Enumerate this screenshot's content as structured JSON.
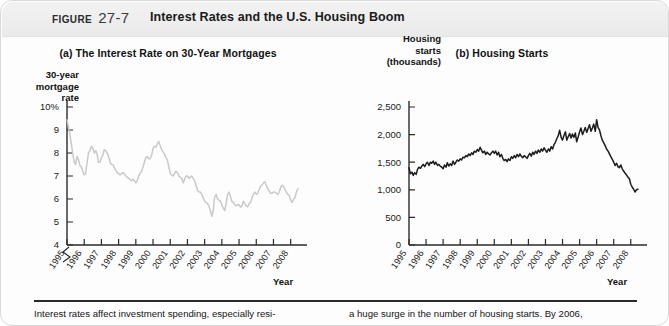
{
  "header": {
    "figure_word": "Figure",
    "figure_number": "27-7",
    "title": "Interest Rates and the U.S. Housing Boom"
  },
  "caption": {
    "left": "Interest rates affect investment spending, especially resi-",
    "right": "a huge surge in the number of housing starts. By 2006,"
  },
  "panel_a": {
    "title": "(a) The Interest Rate on 30-Year Mortgages",
    "ylabel_lines": [
      "30-year",
      "mortgage",
      "rate"
    ],
    "xlabel": "Year"
  },
  "panel_b": {
    "title": "(b) Housing Starts",
    "ylabel_lines": [
      "Housing",
      "starts",
      "(thousands)"
    ],
    "xlabel": "Year"
  },
  "colors": {
    "line_a": "#c9c9c9",
    "line_b": "#1c1c1c",
    "axis": "#2a2a2a",
    "header_bg": "#efefef"
  },
  "chart_data": [
    {
      "type": "line",
      "id": "panel-a",
      "title": "(a) The Interest Rate on 30-Year Mortgages",
      "xlabel": "Year",
      "ylabel": "30-year mortgage rate",
      "grid": false,
      "legend": null,
      "axis_break": true,
      "ylim": [
        4,
        10
      ],
      "xlim": [
        1995,
        2008.6
      ],
      "yticks": [
        4,
        5,
        6,
        7,
        8,
        9,
        10
      ],
      "yticklabels": [
        "4",
        "5",
        "6",
        "7",
        "8",
        "9",
        "10%"
      ],
      "xticks": [
        1995,
        1996,
        1997,
        1998,
        1999,
        2000,
        2001,
        2002,
        2003,
        2004,
        2005,
        2006,
        2007,
        2008
      ],
      "xticklabels": [
        "1995",
        "1996",
        "1997",
        "1998",
        "1999",
        "2000",
        "2001",
        "2002",
        "2003",
        "2004",
        "2005",
        "2006",
        "2007",
        "2008"
      ],
      "x": [
        1995.0,
        1995.08,
        1995.17,
        1995.25,
        1995.33,
        1995.42,
        1995.5,
        1995.58,
        1995.67,
        1995.75,
        1995.83,
        1995.92,
        1996.0,
        1996.08,
        1996.17,
        1996.25,
        1996.33,
        1996.42,
        1996.5,
        1996.58,
        1996.67,
        1996.75,
        1996.83,
        1996.92,
        1997.0,
        1997.08,
        1997.17,
        1997.25,
        1997.33,
        1997.42,
        1997.5,
        1997.58,
        1997.67,
        1997.75,
        1997.83,
        1997.92,
        1998.0,
        1998.08,
        1998.17,
        1998.25,
        1998.33,
        1998.42,
        1998.5,
        1998.58,
        1998.67,
        1998.75,
        1998.83,
        1998.92,
        1999.0,
        1999.08,
        1999.17,
        1999.25,
        1999.33,
        1999.42,
        1999.5,
        1999.58,
        1999.67,
        1999.75,
        1999.83,
        1999.92,
        2000.0,
        2000.08,
        2000.17,
        2000.25,
        2000.33,
        2000.42,
        2000.5,
        2000.58,
        2000.67,
        2000.75,
        2000.83,
        2000.92,
        2001.0,
        2001.08,
        2001.17,
        2001.25,
        2001.33,
        2001.42,
        2001.5,
        2001.58,
        2001.67,
        2001.75,
        2001.83,
        2001.92,
        2002.0,
        2002.08,
        2002.17,
        2002.25,
        2002.33,
        2002.42,
        2002.5,
        2002.58,
        2002.67,
        2002.75,
        2002.83,
        2002.92,
        2003.0,
        2003.08,
        2003.17,
        2003.25,
        2003.33,
        2003.42,
        2003.5,
        2003.58,
        2003.67,
        2003.75,
        2003.83,
        2003.92,
        2004.0,
        2004.08,
        2004.17,
        2004.25,
        2004.33,
        2004.42,
        2004.5,
        2004.58,
        2004.67,
        2004.75,
        2004.83,
        2004.92,
        2005.0,
        2005.08,
        2005.17,
        2005.25,
        2005.33,
        2005.42,
        2005.5,
        2005.58,
        2005.67,
        2005.75,
        2005.83,
        2005.92,
        2006.0,
        2006.08,
        2006.17,
        2006.25,
        2006.33,
        2006.42,
        2006.5,
        2006.58,
        2006.67,
        2006.75,
        2006.83,
        2006.92,
        2007.0,
        2007.08,
        2007.17,
        2007.25,
        2007.33,
        2007.42,
        2007.5,
        2007.58,
        2007.67,
        2007.75,
        2007.83,
        2007.92,
        2008.0,
        2008.08,
        2008.17,
        2008.25,
        2008.33,
        2008.42
      ],
      "y": [
        9.45,
        9.15,
        8.8,
        8.4,
        8.0,
        7.6,
        7.5,
        7.85,
        7.7,
        7.45,
        7.4,
        7.2,
        7.05,
        7.1,
        7.6,
        8.0,
        8.1,
        8.3,
        8.2,
        8.0,
        8.1,
        7.95,
        7.6,
        7.6,
        7.8,
        7.9,
        8.15,
        8.1,
        8.0,
        7.85,
        7.6,
        7.5,
        7.5,
        7.35,
        7.25,
        7.15,
        7.1,
        7.05,
        7.1,
        7.15,
        7.1,
        7.0,
        6.95,
        6.9,
        6.85,
        6.8,
        6.85,
        6.8,
        6.7,
        6.8,
        7.0,
        7.1,
        7.2,
        7.4,
        7.6,
        7.8,
        7.85,
        7.75,
        7.75,
        7.9,
        8.2,
        8.3,
        8.25,
        8.4,
        8.5,
        8.3,
        8.15,
        8.05,
        7.95,
        7.8,
        7.7,
        7.4,
        7.1,
        7.05,
        7.0,
        7.1,
        7.2,
        7.15,
        7.0,
        6.95,
        6.9,
        6.7,
        6.85,
        7.0,
        7.0,
        6.9,
        6.95,
        7.0,
        6.9,
        6.8,
        6.6,
        6.4,
        6.3,
        6.3,
        6.2,
        6.05,
        5.9,
        5.85,
        5.8,
        5.7,
        5.5,
        5.25,
        5.5,
        6.1,
        6.2,
        6.0,
        5.95,
        5.9,
        5.75,
        5.6,
        5.5,
        5.8,
        6.2,
        6.3,
        6.1,
        5.9,
        5.85,
        5.75,
        5.7,
        5.75,
        5.75,
        5.65,
        5.7,
        5.9,
        5.8,
        5.7,
        5.65,
        5.8,
        5.85,
        6.05,
        6.2,
        6.3,
        6.2,
        6.25,
        6.4,
        6.55,
        6.6,
        6.7,
        6.75,
        6.6,
        6.45,
        6.35,
        6.25,
        6.25,
        6.3,
        6.3,
        6.25,
        6.2,
        6.3,
        6.5,
        6.6,
        6.55,
        6.4,
        6.3,
        6.2,
        6.15,
        5.95,
        5.85,
        6.0,
        6.05,
        6.3,
        6.45
      ]
    },
    {
      "type": "line",
      "id": "panel-b",
      "title": "(b) Housing Starts",
      "xlabel": "Year",
      "ylabel": "Housing starts (thousands)",
      "grid": false,
      "legend": null,
      "axis_break": false,
      "ylim": [
        0,
        2500
      ],
      "xlim": [
        1995,
        2008.6
      ],
      "yticks": [
        0,
        500,
        1000,
        1500,
        2000,
        2500
      ],
      "yticklabels": [
        "0",
        "500",
        "1,000",
        "1,500",
        "2,000",
        "2,500"
      ],
      "xticks": [
        1995,
        1996,
        1997,
        1998,
        1999,
        2000,
        2001,
        2002,
        2003,
        2004,
        2005,
        2006,
        2007,
        2008
      ],
      "xticklabels": [
        "1995",
        "1996",
        "1997",
        "1998",
        "1999",
        "2000",
        "2001",
        "2002",
        "2003",
        "2004",
        "2005",
        "2006",
        "2007",
        "2008"
      ],
      "x": [
        1995.0,
        1995.08,
        1995.17,
        1995.25,
        1995.33,
        1995.42,
        1995.5,
        1995.58,
        1995.67,
        1995.75,
        1995.83,
        1995.92,
        1996.0,
        1996.08,
        1996.17,
        1996.25,
        1996.33,
        1996.42,
        1996.5,
        1996.58,
        1996.67,
        1996.75,
        1996.83,
        1996.92,
        1997.0,
        1997.08,
        1997.17,
        1997.25,
        1997.33,
        1997.42,
        1997.5,
        1997.58,
        1997.67,
        1997.75,
        1997.83,
        1997.92,
        1998.0,
        1998.08,
        1998.17,
        1998.25,
        1998.33,
        1998.42,
        1998.5,
        1998.58,
        1998.67,
        1998.75,
        1998.83,
        1998.92,
        1999.0,
        1999.08,
        1999.17,
        1999.25,
        1999.33,
        1999.42,
        1999.5,
        1999.58,
        1999.67,
        1999.75,
        1999.83,
        1999.92,
        2000.0,
        2000.08,
        2000.17,
        2000.25,
        2000.33,
        2000.42,
        2000.5,
        2000.58,
        2000.67,
        2000.75,
        2000.83,
        2000.92,
        2001.0,
        2001.08,
        2001.17,
        2001.25,
        2001.33,
        2001.42,
        2001.5,
        2001.58,
        2001.67,
        2001.75,
        2001.83,
        2001.92,
        2002.0,
        2002.08,
        2002.17,
        2002.25,
        2002.33,
        2002.42,
        2002.5,
        2002.58,
        2002.67,
        2002.75,
        2002.83,
        2002.92,
        2003.0,
        2003.08,
        2003.17,
        2003.25,
        2003.33,
        2003.42,
        2003.5,
        2003.58,
        2003.67,
        2003.75,
        2003.83,
        2003.92,
        2004.0,
        2004.08,
        2004.17,
        2004.25,
        2004.33,
        2004.42,
        2004.5,
        2004.58,
        2004.67,
        2004.75,
        2004.83,
        2004.92,
        2005.0,
        2005.08,
        2005.17,
        2005.25,
        2005.33,
        2005.42,
        2005.5,
        2005.58,
        2005.67,
        2005.75,
        2005.83,
        2005.92,
        2006.0,
        2006.08,
        2006.17,
        2006.25,
        2006.33,
        2006.42,
        2006.5,
        2006.58,
        2006.67,
        2006.75,
        2006.83,
        2006.92,
        2007.0,
        2007.08,
        2007.17,
        2007.25,
        2007.33,
        2007.42,
        2007.5,
        2007.58,
        2007.67,
        2007.75,
        2007.83,
        2007.92,
        2008.0,
        2008.08,
        2008.17,
        2008.25,
        2008.33,
        2008.42
      ],
      "y": [
        1400,
        1290,
        1320,
        1260,
        1310,
        1280,
        1370,
        1410,
        1390,
        1430,
        1460,
        1420,
        1470,
        1500,
        1440,
        1500,
        1480,
        1520,
        1460,
        1500,
        1440,
        1460,
        1430,
        1410,
        1380,
        1450,
        1410,
        1490,
        1430,
        1470,
        1440,
        1520,
        1460,
        1500,
        1540,
        1520,
        1560,
        1540,
        1590,
        1580,
        1620,
        1600,
        1650,
        1620,
        1670,
        1640,
        1700,
        1680,
        1730,
        1700,
        1770,
        1720,
        1670,
        1700,
        1640,
        1680,
        1650,
        1630,
        1670,
        1700,
        1660,
        1700,
        1630,
        1680,
        1600,
        1640,
        1570,
        1530,
        1550,
        1510,
        1560,
        1530,
        1600,
        1570,
        1620,
        1580,
        1640,
        1600,
        1650,
        1610,
        1580,
        1620,
        1600,
        1570,
        1620,
        1660,
        1610,
        1680,
        1640,
        1700,
        1660,
        1720,
        1680,
        1740,
        1700,
        1760,
        1720,
        1680,
        1740,
        1700,
        1780,
        1740,
        1820,
        1860,
        1930,
        1980,
        2080,
        1950,
        1900,
        1980,
        2050,
        1900,
        1960,
        2020,
        1940,
        2010,
        1950,
        2030,
        1870,
        1960,
        2050,
        2120,
        2000,
        2060,
        2130,
        2040,
        2110,
        2180,
        2060,
        2120,
        2190,
        2060,
        2270,
        2130,
        2080,
        1980,
        1900,
        1850,
        1800,
        1740,
        1700,
        1650,
        1600,
        1550,
        1500,
        1440,
        1480,
        1420,
        1400,
        1450,
        1380,
        1340,
        1300,
        1270,
        1230,
        1200,
        1100,
        1050,
        1010,
        960,
        1000,
        1010
      ]
    }
  ]
}
